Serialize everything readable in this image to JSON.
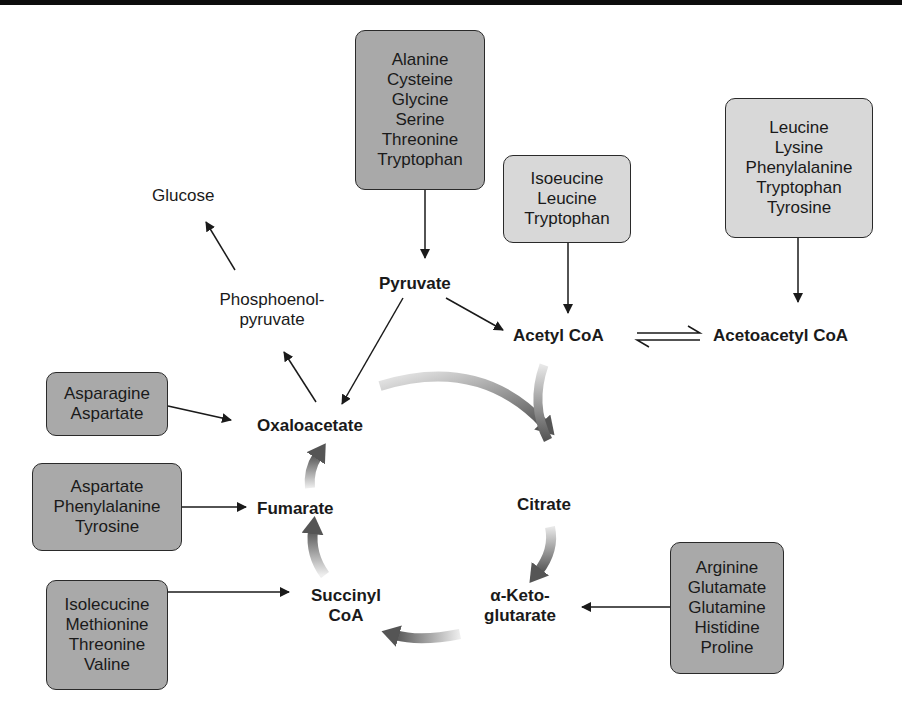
{
  "diagram": {
    "intermediates": {
      "pyruvate": "Pyruvate",
      "acetyl_coa": "Acetyl CoA",
      "acetoacetyl_coa": "Acetoacetyl CoA",
      "oxaloacetate": "Oxaloacetate",
      "citrate": "Citrate",
      "alpha_ketoglutarate_line1": "α-Keto-",
      "alpha_ketoglutarate_line2": "glutarate",
      "succinyl_coa_line1": "Succinyl",
      "succinyl_coa_line2": "CoA",
      "fumarate": "Fumarate",
      "pep_line1": "Phosphoenol-",
      "pep_line2": "pyruvate",
      "glucose": "Glucose"
    },
    "boxes": {
      "to_pyruvate": {
        "shade": "dark",
        "items": [
          "Alanine",
          "Cysteine",
          "Glycine",
          "Serine",
          "Threonine",
          "Tryptophan"
        ]
      },
      "to_acetyl_coa": {
        "shade": "light",
        "items": [
          "Isoeucine",
          "Leucine",
          "Tryptophan"
        ]
      },
      "to_acetoacetyl_coa": {
        "shade": "light",
        "items": [
          "Leucine",
          "Lysine",
          "Phenylalanine",
          "Tryptophan",
          "Tyrosine"
        ]
      },
      "to_oxaloacetate": {
        "shade": "dark",
        "items": [
          "Asparagine",
          "Aspartate"
        ]
      },
      "to_fumarate": {
        "shade": "dark",
        "items": [
          "Aspartate",
          "Phenylalanine",
          "Tyrosine"
        ]
      },
      "to_succinyl_coa": {
        "shade": "dark",
        "items": [
          "Isolecucine",
          "Methionine",
          "Threonine",
          "Valine"
        ]
      },
      "to_alpha_ketoglutarate": {
        "shade": "dark",
        "items": [
          "Arginine",
          "Glutamate",
          "Glutamine",
          "Histidine",
          "Proline"
        ]
      }
    },
    "colors": {
      "dark_box": "#a9a9a9",
      "light_box": "#d8d8d8",
      "cycle_arrow": "#555555",
      "line": "#1a1a1a"
    }
  }
}
